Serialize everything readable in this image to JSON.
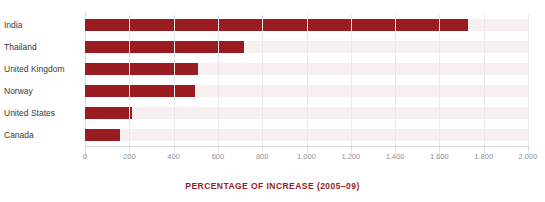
{
  "clipped_top_text": "",
  "colors": {
    "bar": "#9b1c20",
    "track": "#f8eff1",
    "gridline": "#e9eaee",
    "axis": "#d8d9de",
    "category_label": "#3a3a3e",
    "tick_label": "#8e8f96",
    "axis_title": "#9b1c20"
  },
  "chart_data": {
    "type": "bar",
    "orientation": "horizontal",
    "title": "",
    "xlabel": "PERCENTAGE OF INCREASE (2005–09)",
    "ylabel": "",
    "categories": [
      "India",
      "Thailand",
      "United Kingdom",
      "Norway",
      "United States",
      "Canada"
    ],
    "values": [
      1730,
      720,
      510,
      495,
      210,
      160
    ],
    "xlim": [
      0,
      2000
    ],
    "xticks": [
      0,
      200,
      400,
      600,
      800,
      1000,
      1200,
      1400,
      1600,
      1800,
      2000
    ],
    "xticklabels": [
      "0",
      "200",
      "400",
      "600",
      "800",
      "1.000",
      "1.200",
      "1.400",
      "1.600",
      "1.800",
      "2.000"
    ],
    "grid": true,
    "grid_axis": "x",
    "legend": false,
    "legend_position": "none",
    "series": [
      {
        "name": "Percentage of increase (2005-09)",
        "values": [
          1730,
          720,
          510,
          495,
          210,
          160
        ]
      }
    ]
  }
}
